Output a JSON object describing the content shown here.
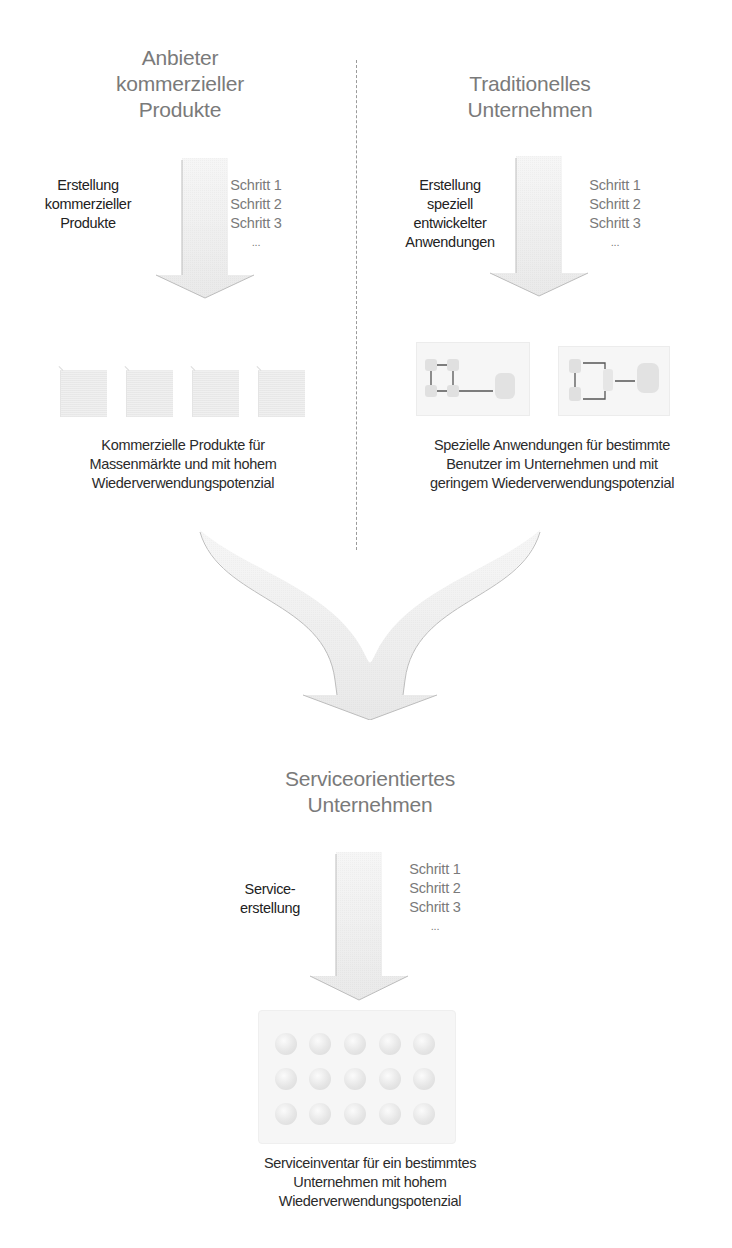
{
  "left_column": {
    "heading": [
      "Anbieter",
      "kommerzieller",
      "Produkte"
    ],
    "process_label": [
      "Erstellung",
      "kommerzieller",
      "Produkte"
    ],
    "steps": [
      "Schritt 1",
      "Schritt 2",
      "Schritt 3",
      "..."
    ],
    "output_icon_count": 4,
    "output_icon": "product-box-icon",
    "caption": [
      "Kommerzielle Produkte für",
      "Massenmärkte und mit hohem",
      "Wiederverwendungspotenzial"
    ]
  },
  "right_column": {
    "heading": [
      "Traditionelles",
      "Unternehmen"
    ],
    "process_label": [
      "Erstellung",
      "speziell",
      "entwickelter",
      "Anwendungen"
    ],
    "steps": [
      "Schritt 1",
      "Schritt 2",
      "Schritt 3",
      "..."
    ],
    "output_icon_count": 2,
    "output_icon": "application-diagram-icon",
    "caption": [
      "Spezielle Anwendungen für bestimmte",
      "Benutzer im Unternehmen und mit",
      "geringem Wiederverwendungspotenzial"
    ]
  },
  "merge": {
    "arrow": "merge-arrow-icon"
  },
  "bottom_section": {
    "heading": [
      "Serviceorientiertes",
      "Unternehmen"
    ],
    "process_label": [
      "Service-",
      "erstellung"
    ],
    "steps": [
      "Schritt 1",
      "Schritt 2",
      "Schritt 3",
      "..."
    ],
    "inventory_grid": {
      "rows": 3,
      "cols": 5,
      "icon": "service-ball-icon"
    },
    "caption": [
      "Serviceinventar für ein bestimmtes",
      "Unternehmen mit hohem",
      "Wiederverwendungspotenzial"
    ]
  },
  "colors": {
    "heading": "#7a7a7a",
    "label": "#222222",
    "arrow_fill": "#e9e9e9",
    "arrow_edge": "#b8b8b8",
    "divider": "#9a9a9a"
  }
}
